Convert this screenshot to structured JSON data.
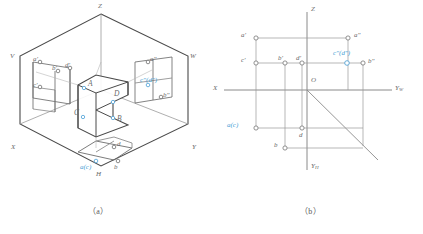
{
  "figure": {
    "captions": [
      {
        "id": "caption-a",
        "text": "（a）",
        "x": 92,
        "y": 206
      },
      {
        "id": "caption-b",
        "text": "（b）",
        "x": 306,
        "y": 206
      }
    ],
    "colors": {
      "line": "#6d6d6d",
      "thin_line": "#9a9a9a",
      "solid_edge": "#4a4a4a",
      "highlight_blue": "#4b9fd5",
      "text": "#6a6a6a",
      "background": "#ffffff"
    }
  },
  "panel_a": {
    "name": "pictorial-trihedral-view",
    "plane_labels": [
      {
        "id": "label-V",
        "text": "V",
        "x": 10,
        "y": 57
      },
      {
        "id": "label-W",
        "text": "W",
        "x": 190,
        "y": 57
      },
      {
        "id": "label-H",
        "text": "H",
        "x": 96,
        "y": 175
      }
    ],
    "axis_labels": [
      {
        "id": "axis-Z",
        "text": "Z",
        "x": 98,
        "y": 6
      },
      {
        "id": "axis-X",
        "text": "X",
        "x": 11,
        "y": 148
      },
      {
        "id": "axis-Y",
        "text": "Y",
        "x": 192,
        "y": 148
      }
    ],
    "solid_vertex_labels": [
      {
        "id": "vertex-A",
        "text": "A",
        "x": 88,
        "y": 84
      },
      {
        "id": "vertex-B",
        "text": "B",
        "x": 117,
        "y": 119
      },
      {
        "id": "vertex-C",
        "text": "C",
        "x": 76,
        "y": 113
      },
      {
        "id": "vertex-D",
        "text": "D",
        "x": 114,
        "y": 94
      }
    ],
    "v_plane_projections": [
      {
        "id": "point-a-prime",
        "text": "a'",
        "x": 34,
        "y": 62,
        "blue": false
      },
      {
        "id": "point-b-prime",
        "text": "b'",
        "x": 53,
        "y": 71,
        "blue": false
      },
      {
        "id": "point-d-prime",
        "text": "d'",
        "x": 68,
        "y": 68,
        "blue": false
      },
      {
        "id": "point-c-prime",
        "text": "c'",
        "x": 36,
        "y": 87,
        "blue": false
      }
    ],
    "w_plane_projections": [
      {
        "id": "point-a-dprime",
        "text": "a\"",
        "x": 141,
        "y": 62,
        "blue": false
      },
      {
        "id": "point-cd-dprime",
        "text": "c\"(d\")",
        "x": 139,
        "y": 83,
        "blue": true
      },
      {
        "id": "point-b-dprime",
        "text": "b\"",
        "x": 155,
        "y": 101,
        "blue": false
      }
    ],
    "h_plane_projections": [
      {
        "id": "point-d-h",
        "text": "d",
        "x": 117,
        "y": 145,
        "blue": false
      },
      {
        "id": "point-ac-h",
        "text": "a(c)",
        "x": 81,
        "y": 168,
        "blue": true
      },
      {
        "id": "point-b-h",
        "text": "b",
        "x": 112,
        "y": 168,
        "blue": false
      }
    ]
  },
  "panel_b": {
    "name": "two-dimensional-projection-view",
    "origin_label": {
      "id": "origin-O",
      "text": "O",
      "x": 99,
      "y": 80
    },
    "axis_labels": [
      {
        "id": "axis-Z-b",
        "text": "Z",
        "x": 99,
        "y": 9
      },
      {
        "id": "axis-X-b",
        "text": "X",
        "x": 1,
        "y": 88
      },
      {
        "id": "axis-Yw",
        "text": "Y",
        "sub": "W",
        "x": 185,
        "y": 88
      },
      {
        "id": "axis-Yh",
        "text": "Y",
        "sub": "H",
        "x": 99,
        "y": 167
      }
    ],
    "points": [
      {
        "id": "pt-a-prime",
        "label": "a'",
        "px": 44,
        "py": 38,
        "lx": 28,
        "ly": 28,
        "blue": false
      },
      {
        "id": "pt-a-dprime",
        "label": "a\"",
        "px": 136,
        "py": 38,
        "lx": 142,
        "ly": 28,
        "blue": false
      },
      {
        "id": "pt-c-prime",
        "label": "c'",
        "px": 44,
        "py": 63,
        "lx": 28,
        "ly": 53,
        "blue": false
      },
      {
        "id": "pt-b-prime",
        "label": "b'",
        "px": 73,
        "py": 63,
        "lx": 66,
        "ly": 53,
        "blue": false
      },
      {
        "id": "pt-d-prime",
        "label": "d'",
        "px": 90,
        "py": 63,
        "lx": 84,
        "ly": 53,
        "blue": false
      },
      {
        "id": "pt-cd-dprime",
        "label": "c\"(d\")",
        "px": 135,
        "py": 63,
        "lx": 122,
        "ly": 50,
        "blue": true
      },
      {
        "id": "pt-b-dprime",
        "label": "b\"",
        "px": 151,
        "py": 63,
        "lx": 156,
        "ly": 56,
        "blue": false
      },
      {
        "id": "pt-ac-h",
        "label": "a(c)",
        "px": 44,
        "py": 128,
        "lx": 14,
        "ly": 121,
        "blue": true
      },
      {
        "id": "pt-d-h",
        "label": "d",
        "px": 90,
        "py": 128,
        "lx": 86,
        "ly": 133,
        "blue": false
      },
      {
        "id": "pt-b-h",
        "label": "b",
        "px": 73,
        "py": 148,
        "lx": 62,
        "ly": 141,
        "blue": false
      }
    ]
  }
}
